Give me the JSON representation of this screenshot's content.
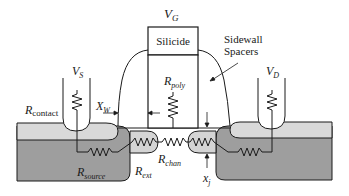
{
  "diagram": {
    "labels": {
      "gate_voltage": "V",
      "gate_voltage_sub": "G",
      "source_voltage": "V",
      "source_voltage_sub": "S",
      "drain_voltage": "V",
      "drain_voltage_sub": "D",
      "silicide": "Silicide",
      "sidewall_line1": "Sidewall",
      "sidewall_line2": "Spacers",
      "r_contact": "R",
      "r_contact_sub": "contact",
      "r_poly": "R",
      "r_poly_sub": "poly",
      "x_w": "X",
      "x_w_sub": "W",
      "r_source": "R",
      "r_source_sub": "source",
      "r_ext": "R",
      "r_ext_sub": "ext",
      "r_chan": "R",
      "r_chan_sub": "chan",
      "x_j": "x",
      "x_j_sub": "j"
    },
    "colors": {
      "line": "#1a1a1a",
      "light_fill": "#d9d9d9",
      "dark_fill": "#9e9e9e",
      "ext_fill": "#d4d4d4",
      "background": "#ffffff"
    }
  }
}
